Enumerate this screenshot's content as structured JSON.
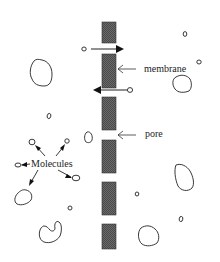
{
  "diagram": {
    "labels": {
      "membrane": "membrane",
      "pore": "pore",
      "molecules": "Molecules"
    },
    "colors": {
      "membrane_fill": "#5a5a5a",
      "stroke": "#222222",
      "background": "#ffffff"
    },
    "membrane_blocks": 6,
    "transport_arrows": [
      {
        "direction": "right",
        "y": 48
      },
      {
        "direction": "left",
        "y": 90
      }
    ]
  }
}
